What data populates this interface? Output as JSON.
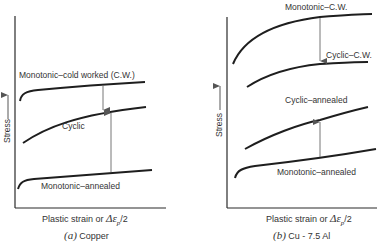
{
  "panels": [
    {
      "id": "a",
      "caption_letter": "(a)",
      "caption_text": "Copper",
      "xlabel_prefix": "Plastic strain or ",
      "xlabel_symbol": "Δε",
      "xlabel_sub": "p",
      "xlabel_suffix": "/2",
      "ylabel": "Stress",
      "curves": [
        {
          "label": "Monotonic–cold worked (C.W.)"
        },
        {
          "label": "Cyclic"
        },
        {
          "label": "Monotonic–annealed"
        }
      ]
    },
    {
      "id": "b",
      "caption_letter": "(b)",
      "caption_text": "Cu - 7.5 Al",
      "xlabel_prefix": "Plastic strain or ",
      "xlabel_symbol": "Δε",
      "xlabel_sub": "p",
      "xlabel_suffix": "/2",
      "ylabel": "Stress",
      "curves": [
        {
          "label": "Monotonic–C.W."
        },
        {
          "label": "Cyclic–C.W."
        },
        {
          "label": "Cyclic–annealed"
        },
        {
          "label": "Monotonic–annealed"
        }
      ]
    }
  ],
  "colors": {
    "ink": "#2a2a2a",
    "arrow": "#666666",
    "background": "#ffffff"
  }
}
